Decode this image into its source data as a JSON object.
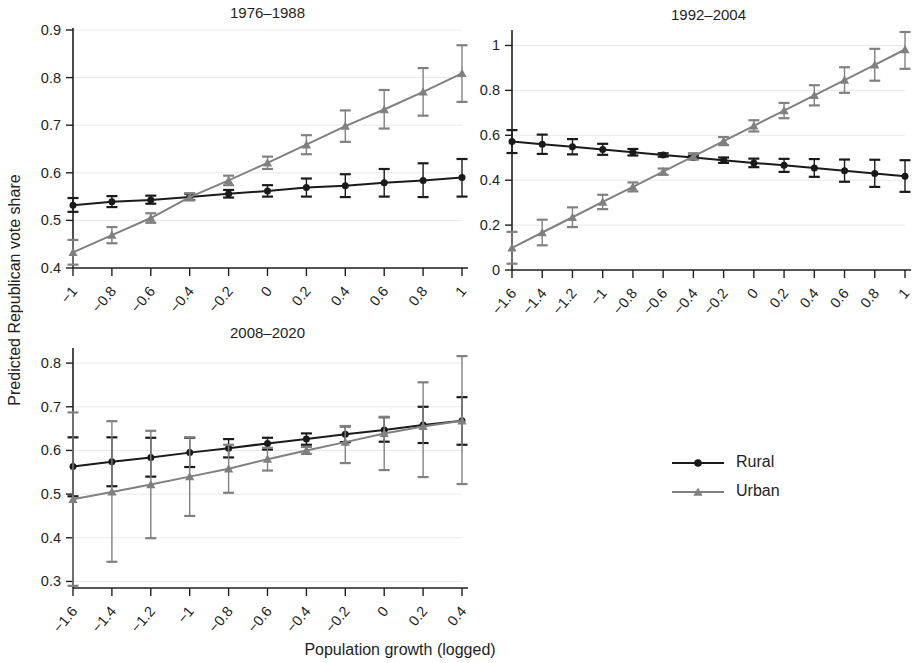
{
  "figure": {
    "xlabel": "Population growth (logged)",
    "ylabel": "Predicted Republican vote share",
    "series_colors": {
      "rural": "#1a1a1a",
      "urban": "#808080"
    },
    "legend": {
      "position": "bottom-right",
      "entries": [
        {
          "label": "Rural",
          "marker": "circle",
          "color": "#1a1a1a"
        },
        {
          "label": "Urban",
          "marker": "triangle",
          "color": "#808080"
        }
      ]
    }
  },
  "chart_data": [
    {
      "type": "line",
      "title": "1976–1988",
      "xlabel": "Population growth (logged)",
      "ylabel": "Predicted Republican vote share",
      "x": [
        -1,
        -0.8,
        -0.6,
        -0.4,
        -0.2,
        0,
        0.2,
        0.4,
        0.6,
        0.8,
        1
      ],
      "xtick_labels": [
        "−1",
        "−0.8",
        "−0.6",
        "−0.4",
        "−0.2",
        "0",
        "0.2",
        "0.4",
        "0.6",
        "0.8",
        "1"
      ],
      "ylim": [
        0.4,
        0.9
      ],
      "yticks": [
        0.4,
        0.5,
        0.6,
        0.7,
        0.8,
        0.9
      ],
      "ytick_labels": [
        "0.4",
        "0.5",
        "0.6",
        "0.7",
        "0.8",
        "0.9"
      ],
      "grid": true,
      "series": [
        {
          "name": "Rural",
          "marker": "circle",
          "color": "#1a1a1a",
          "values": [
            0.532,
            0.539,
            0.543,
            0.549,
            0.556,
            0.562,
            0.569,
            0.573,
            0.579,
            0.584,
            0.59
          ],
          "ci_low": [
            0.518,
            0.528,
            0.535,
            0.543,
            0.548,
            0.55,
            0.55,
            0.549,
            0.55,
            0.549,
            0.55
          ],
          "ci_high": [
            0.547,
            0.551,
            0.552,
            0.556,
            0.564,
            0.574,
            0.588,
            0.597,
            0.608,
            0.62,
            0.629
          ]
        },
        {
          "name": "Urban",
          "marker": "triangle",
          "color": "#808080",
          "values": [
            0.433,
            0.469,
            0.505,
            0.549,
            0.584,
            0.621,
            0.659,
            0.698,
            0.733,
            0.77,
            0.809
          ],
          "ci_low": [
            0.407,
            0.452,
            0.495,
            0.542,
            0.574,
            0.608,
            0.639,
            0.665,
            0.693,
            0.72,
            0.749
          ],
          "ci_high": [
            0.459,
            0.486,
            0.515,
            0.557,
            0.594,
            0.634,
            0.679,
            0.731,
            0.774,
            0.82,
            0.868
          ]
        }
      ]
    },
    {
      "type": "line",
      "title": "1992–2004",
      "xlabel": "Population growth (logged)",
      "ylabel": "Predicted Republican vote share",
      "x": [
        -1.6,
        -1.4,
        -1.2,
        -1,
        -0.8,
        -0.6,
        -0.4,
        -0.2,
        0,
        0.2,
        0.4,
        0.6,
        0.8,
        1
      ],
      "xtick_labels": [
        "−1.6",
        "−1.4",
        "−1.2",
        "−1",
        "−0.8",
        "−0.6",
        "−0.4",
        "−0.2",
        "0",
        "0.2",
        "0.4",
        "0.6",
        "0.8",
        "1"
      ],
      "ylim": [
        0,
        1.06
      ],
      "yticks": [
        0,
        0.2,
        0.4,
        0.6,
        0.8,
        1
      ],
      "ytick_labels": [
        "0",
        "0.2",
        "0.4",
        "0.6",
        "0.8",
        "1"
      ],
      "grid": true,
      "series": [
        {
          "name": "Rural",
          "marker": "circle",
          "color": "#1a1a1a",
          "values": [
            0.572,
            0.56,
            0.549,
            0.537,
            0.524,
            0.512,
            0.501,
            0.489,
            0.477,
            0.466,
            0.454,
            0.442,
            0.43,
            0.418
          ],
          "ci_low": [
            0.521,
            0.517,
            0.515,
            0.513,
            0.51,
            0.505,
            0.494,
            0.477,
            0.458,
            0.437,
            0.415,
            0.393,
            0.37,
            0.348
          ],
          "ci_high": [
            0.623,
            0.603,
            0.583,
            0.562,
            0.539,
            0.52,
            0.509,
            0.501,
            0.496,
            0.495,
            0.494,
            0.492,
            0.491,
            0.489
          ]
        },
        {
          "name": "Urban",
          "marker": "triangle",
          "color": "#808080",
          "values": [
            0.099,
            0.167,
            0.235,
            0.303,
            0.37,
            0.438,
            0.506,
            0.574,
            0.642,
            0.71,
            0.778,
            0.846,
            0.914,
            0.982
          ],
          "ci_low": [
            0.028,
            0.11,
            0.191,
            0.271,
            0.35,
            0.424,
            0.492,
            0.556,
            0.617,
            0.676,
            0.733,
            0.789,
            0.843,
            0.896
          ],
          "ci_high": [
            0.17,
            0.224,
            0.279,
            0.335,
            0.39,
            0.452,
            0.52,
            0.592,
            0.667,
            0.744,
            0.823,
            0.903,
            0.985,
            1.067
          ]
        }
      ]
    },
    {
      "type": "line",
      "title": "2008–2020",
      "xlabel": "Population growth (logged)",
      "ylabel": "Predicted Republican vote share",
      "x": [
        -1.6,
        -1.4,
        -1.2,
        -1,
        -0.8,
        -0.6,
        -0.4,
        -0.2,
        0,
        0.2,
        0.4
      ],
      "xtick_labels": [
        "−1.6",
        "−1.4",
        "−1.2",
        "−1",
        "−0.8",
        "−0.6",
        "−0.4",
        "−0.2",
        "0",
        "0.2",
        "0.4"
      ],
      "ylim": [
        0.285,
        0.83
      ],
      "yticks": [
        0.3,
        0.4,
        0.5,
        0.6,
        0.7,
        0.8
      ],
      "ytick_labels": [
        "0.3",
        "0.4",
        "0.5",
        "0.6",
        "0.7",
        "0.8"
      ],
      "grid": true,
      "series": [
        {
          "name": "Rural",
          "marker": "circle",
          "color": "#1a1a1a",
          "values": [
            0.563,
            0.574,
            0.584,
            0.595,
            0.605,
            0.616,
            0.626,
            0.637,
            0.647,
            0.658,
            0.668
          ],
          "ci_low": [
            0.495,
            0.518,
            0.54,
            0.562,
            0.584,
            0.602,
            0.613,
            0.619,
            0.62,
            0.617,
            0.613
          ],
          "ci_high": [
            0.63,
            0.63,
            0.629,
            0.629,
            0.626,
            0.629,
            0.639,
            0.655,
            0.676,
            0.7,
            0.722
          ]
        },
        {
          "name": "Urban",
          "marker": "triangle",
          "color": "#808080",
          "values": [
            0.488,
            0.505,
            0.522,
            0.54,
            0.558,
            0.58,
            0.6,
            0.619,
            0.639,
            0.655,
            0.668
          ],
          "ci_low": [
            0.29,
            0.345,
            0.399,
            0.45,
            0.503,
            0.554,
            0.592,
            0.571,
            0.555,
            0.539,
            0.523
          ],
          "ci_high": [
            0.687,
            0.667,
            0.645,
            0.63,
            0.613,
            0.606,
            0.608,
            0.656,
            0.677,
            0.756,
            0.816
          ]
        }
      ]
    }
  ]
}
